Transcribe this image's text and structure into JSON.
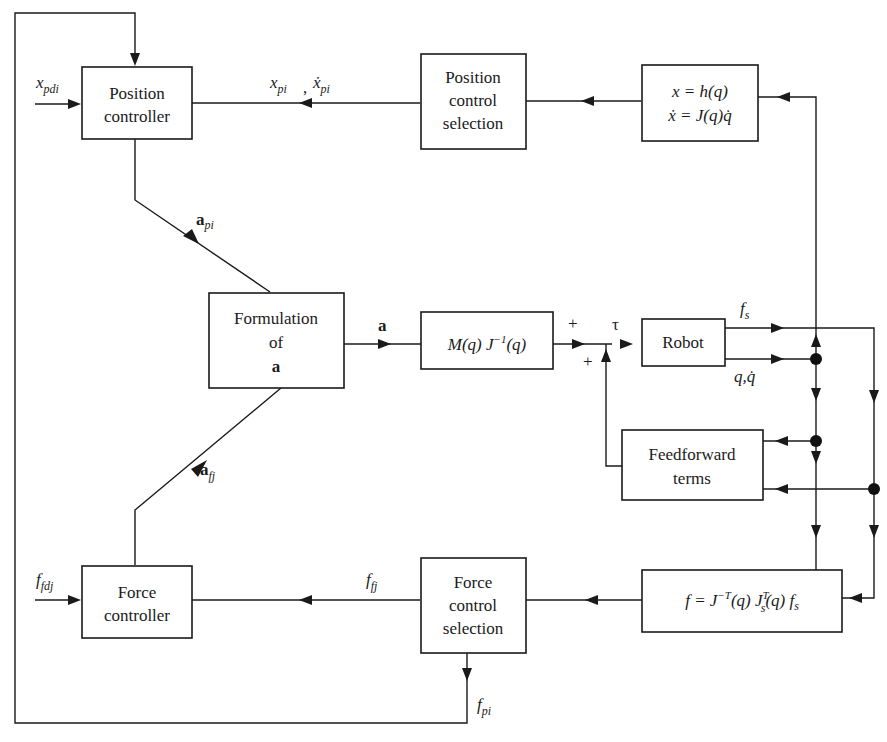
{
  "diagram": {
    "type": "control-block-diagram"
  },
  "blocks": {
    "position_controller": [
      "Position",
      "controller"
    ],
    "position_selection": [
      "Position",
      "control",
      "selection"
    ],
    "kinematics": [
      "x = h(q)",
      "ẋ = J(q)q̇"
    ],
    "formulation": [
      "Formulation",
      "of",
      "a"
    ],
    "mass_jacobian": "M(q) J⁻¹(q)",
    "robot": "Robot",
    "feedforward": [
      "Feedforward",
      "terms"
    ],
    "force_transform": "f = J⁻ᵀ(q) Jₛᵀ(q) fₛ",
    "force_controller": [
      "Force",
      "controller"
    ],
    "force_selection": [
      "Force",
      "control",
      "selection"
    ]
  },
  "signals": {
    "x_pdi": {
      "base": "x",
      "sub": "pdi"
    },
    "x_pi": {
      "base": "x",
      "sub": "pi"
    },
    "xdot_pi": {
      "base": "ẋ",
      "sub": "pi"
    },
    "comma": ",",
    "a_pi": {
      "base": "a",
      "sub": "pi"
    },
    "a_fj": {
      "base": "a",
      "sub": "fj"
    },
    "a": "a",
    "plus_top": "+",
    "plus_bottom": "+",
    "tau": "τ",
    "f_s": {
      "base": "f",
      "sub": "s"
    },
    "q_qdot": "q,q̇",
    "f_fdj": {
      "base": "f",
      "sub": "fdj"
    },
    "f_fj": {
      "base": "f",
      "sub": "fj"
    },
    "f_pi": {
      "base": "f",
      "sub": "pi"
    }
  },
  "mass_jacobian_parts": {
    "pre": "M(q) J",
    "sup": "−1",
    "post": "(q)"
  },
  "force_transform_parts": {
    "p1": "f = J",
    "sup1": "−T",
    "p2": "(q) J",
    "sup2": "T",
    "sub2": "s",
    "p3": "(q) f",
    "sub3": "s"
  },
  "kinematics_parts": {
    "line1": "x = h(q)",
    "line2": "ẋ = J(q)q̇"
  },
  "colors": {
    "ink": "#1a1a1a",
    "background": "#ffffff"
  }
}
